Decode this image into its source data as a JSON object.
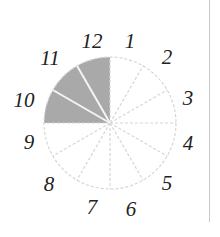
{
  "diagram": {
    "type": "fraction-circle",
    "sectors_total": 12,
    "sectors_shaded": 3,
    "shaded_range": "9 to 12",
    "shade_color": "#a9a9a9",
    "labels": [
      {
        "text": "12",
        "x": 92,
        "y": 41
      },
      {
        "text": "1",
        "x": 130,
        "y": 41
      },
      {
        "text": "2",
        "x": 167,
        "y": 57
      },
      {
        "text": "3",
        "x": 188,
        "y": 98
      },
      {
        "text": "4",
        "x": 188,
        "y": 143
      },
      {
        "text": "5",
        "x": 167,
        "y": 183
      },
      {
        "text": "6",
        "x": 131,
        "y": 209
      },
      {
        "text": "7",
        "x": 92,
        "y": 207
      },
      {
        "text": "8",
        "x": 49,
        "y": 184
      },
      {
        "text": "9",
        "x": 29,
        "y": 142
      },
      {
        "text": "10",
        "x": 24,
        "y": 100
      },
      {
        "text": "11",
        "x": 50,
        "y": 58
      }
    ]
  }
}
